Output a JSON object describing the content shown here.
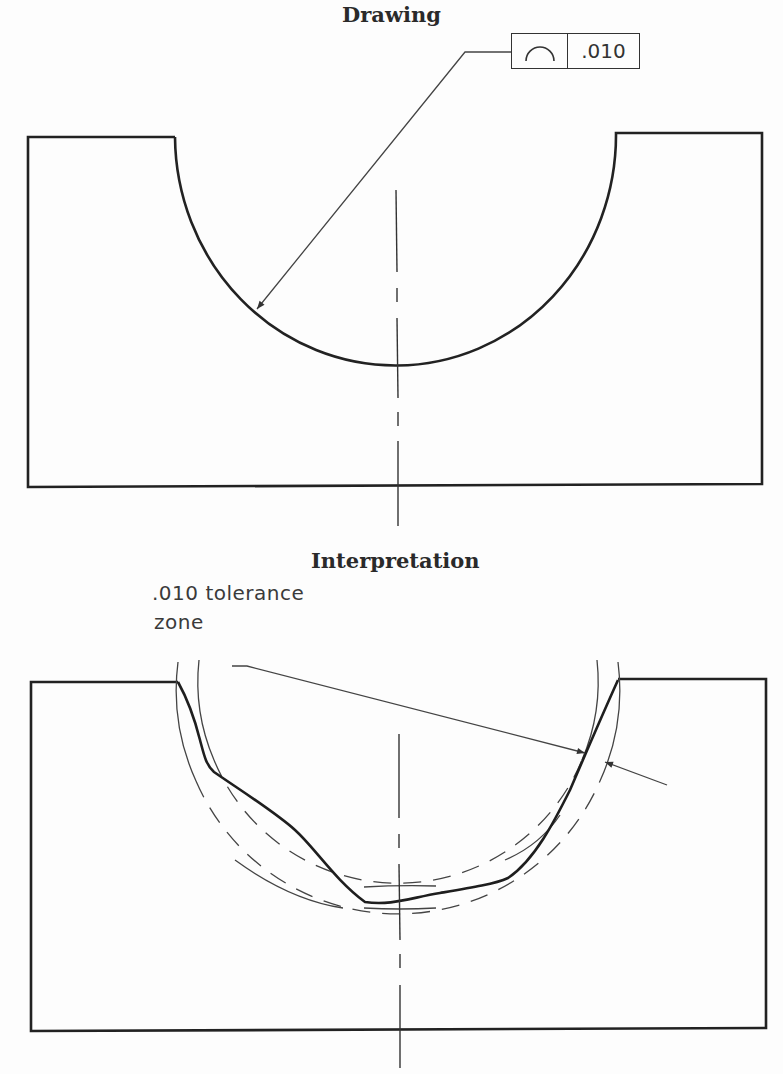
{
  "drawing": {
    "title": "Drawing",
    "feature_control_frame": {
      "symbol": "profile-of-a-line-icon",
      "tolerance": ".010"
    }
  },
  "interpretation": {
    "title": "Interpretation",
    "callout_line1": ".010  tolerance",
    "callout_line2": "zone"
  },
  "colors": {
    "line": "#222222",
    "thin_line": "#444444",
    "background": "#fdfdfd"
  }
}
